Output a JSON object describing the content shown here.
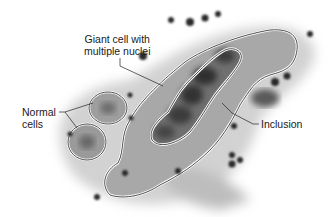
{
  "figure": {
    "labels": {
      "giant_cell_line1": "Giant cell with",
      "giant_cell_line2": "multiple nuclei",
      "normal_line1": "Normal",
      "normal_line2": "cells",
      "inclusion": "Inclusion"
    },
    "colors": {
      "tissue_light": "#c9c9c9",
      "tissue_mid": "#9a9a9a",
      "nuclei_dark": "#3a3a3a",
      "outline": "#222222"
    }
  }
}
